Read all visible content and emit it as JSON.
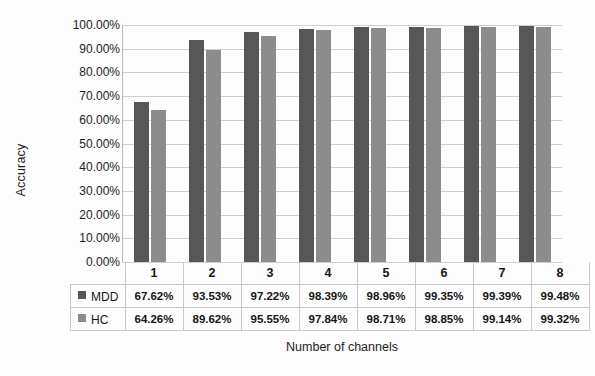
{
  "chart_data": {
    "type": "bar",
    "title": "",
    "xlabel": "Number of channels",
    "ylabel": "Accuracy",
    "categories": [
      "1",
      "2",
      "3",
      "4",
      "5",
      "6",
      "7",
      "8"
    ],
    "series": [
      {
        "name": "MDD",
        "color": "#575757",
        "values": [
          67.62,
          93.53,
          97.22,
          98.39,
          98.96,
          99.35,
          99.39,
          99.48
        ],
        "labels": [
          "67.62%",
          "93.53%",
          "97.22%",
          "98.39%",
          "98.96%",
          "99.35%",
          "99.39%",
          "99.48%"
        ]
      },
      {
        "name": "HC",
        "color": "#8c8c8c",
        "values": [
          64.26,
          89.62,
          95.55,
          97.84,
          98.71,
          98.85,
          99.14,
          99.32
        ],
        "labels": [
          "64.26%",
          "89.62%",
          "95.55%",
          "97.84%",
          "98.71%",
          "98.85%",
          "99.14%",
          "99.32%"
        ]
      }
    ],
    "ylim": [
      0,
      100
    ],
    "ytick_labels": [
      "100.00%",
      "90.00%",
      "80.00%",
      "70.00%",
      "60.00%",
      "50.00%",
      "40.00%",
      "30.00%",
      "20.00%",
      "10.00%",
      "0.00%"
    ],
    "ytick_values": [
      100,
      90,
      80,
      70,
      60,
      50,
      40,
      30,
      20,
      10,
      0
    ],
    "grid": true,
    "legend_position": "data-table"
  }
}
